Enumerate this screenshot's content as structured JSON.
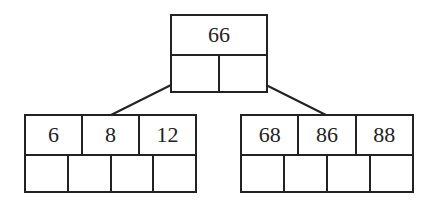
{
  "diagram": {
    "type": "b-tree",
    "root": {
      "keys": [
        "66"
      ],
      "pointer_slots": 2
    },
    "children": [
      {
        "keys": [
          "6",
          "8",
          "12"
        ],
        "pointer_slots": 4
      },
      {
        "keys": [
          "68",
          "86",
          "88"
        ],
        "pointer_slots": 4
      }
    ],
    "colors": {
      "stroke": "#222222",
      "background": "#ffffff"
    }
  }
}
